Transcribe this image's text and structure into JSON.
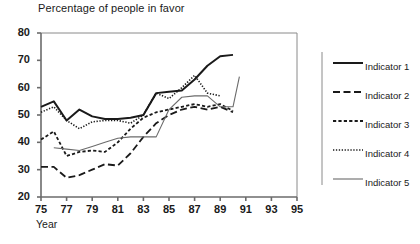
{
  "chart_data": {
    "type": "line",
    "title": "Percentage of people in favor",
    "xlabel": "Year",
    "ylabel": "",
    "xlim": [
      75,
      95
    ],
    "ylim": [
      20,
      80
    ],
    "xticks": [
      75,
      77,
      79,
      81,
      83,
      85,
      87,
      89,
      91,
      93,
      95
    ],
    "yticks": [
      20,
      30,
      40,
      50,
      60,
      70,
      80
    ],
    "grid": false,
    "legend_position": "right",
    "series": [
      {
        "name": "Indicator 1",
        "style": "solid-thick",
        "color": "#1a1a1a",
        "x": [
          75,
          76,
          77,
          78,
          79,
          80,
          81,
          82,
          83,
          84,
          85,
          86,
          87,
          88,
          89,
          90
        ],
        "values": [
          53,
          55,
          48,
          52,
          49.5,
          48.5,
          48.5,
          49,
          50,
          58,
          58.5,
          59,
          63,
          68,
          71.5,
          72
        ]
      },
      {
        "name": "Indicator 2",
        "style": "dashed-long",
        "color": "#1a1a1a",
        "x": [
          75,
          76,
          77,
          78,
          79,
          80,
          81,
          82,
          83,
          84,
          85,
          86,
          87,
          88,
          89,
          90
        ],
        "values": [
          31,
          31,
          27,
          28,
          30,
          32,
          31.5,
          36,
          42,
          47,
          50,
          52,
          53,
          52,
          53,
          51
        ]
      },
      {
        "name": "Indicator 3",
        "style": "dashed-short",
        "color": "#1a1a1a",
        "x": [
          75,
          76,
          77,
          78,
          79,
          80,
          81,
          82,
          83,
          84,
          85,
          86,
          87,
          88,
          89,
          90
        ],
        "values": [
          41,
          44,
          35,
          36.5,
          37,
          36.5,
          40,
          45,
          49,
          51,
          52,
          53,
          54,
          53,
          54,
          51.5
        ]
      },
      {
        "name": "Indicator 4",
        "style": "dotted-fine",
        "color": "#1a1a1a",
        "x": [
          75,
          76,
          77,
          78,
          79,
          80,
          81,
          82,
          83,
          84,
          85,
          86,
          87,
          88,
          89
        ],
        "values": [
          51,
          53,
          48,
          45,
          47.5,
          48,
          48,
          47,
          50,
          58,
          56,
          60,
          64.5,
          58,
          57
        ]
      },
      {
        "name": "Indicator 5",
        "style": "solid-thin",
        "color": "#6b6b6b",
        "x": [
          76,
          77,
          78,
          79,
          80,
          81,
          82,
          83,
          84,
          85,
          86,
          87,
          88,
          89,
          90,
          90.5
        ],
        "values": [
          38,
          37.5,
          37,
          38.5,
          40,
          41.5,
          42,
          42,
          42,
          52,
          56.5,
          57,
          57,
          53,
          53,
          64
        ]
      }
    ]
  },
  "legend": {
    "items": [
      {
        "label": "Indicator 1"
      },
      {
        "label": "Indicator 2"
      },
      {
        "label": "Indicator 3"
      },
      {
        "label": "Indicator 4"
      },
      {
        "label": "Indicator 5"
      }
    ]
  }
}
